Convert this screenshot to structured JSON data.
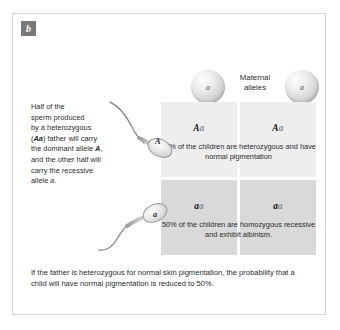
{
  "panel": {
    "badge_letter": "b"
  },
  "sperm_description": {
    "line1": "Half of the",
    "line2": "sperm produced",
    "line3": "by a heterozygous",
    "line4_pre": "(",
    "line4_allele": "Aa",
    "line4_post": ") father will carry",
    "line5_pre": "the dominant allele ",
    "line5_allele": "A",
    "line5_post": ",",
    "line6": "and the other half will",
    "line7": "carry the recessive",
    "line8_pre": "allele ",
    "line8_allele": "a",
    "line8_post": "."
  },
  "maternal": {
    "label_line1": "Maternal",
    "label_line2": "alleles",
    "ovum_left_allele": "a",
    "ovum_right_allele": "a"
  },
  "sperm_cells": [
    {
      "name": "sperm-dominant",
      "allele": "A"
    },
    {
      "name": "sperm-recessive",
      "allele": "a"
    }
  ],
  "punnett": {
    "cells": [
      {
        "dominant": "A",
        "recessive": "a"
      },
      {
        "dominant": "A",
        "recessive": "a"
      },
      {
        "dominant": "a",
        "recessive": "a"
      },
      {
        "dominant": "a",
        "recessive": "a"
      }
    ],
    "outcome_top": "50% of the children are heterozygous and have normal pigmentation",
    "outcome_bottom": "50% of the children are homozygous recessive and exhibit albinism."
  },
  "caption": {
    "text": "If the father is heterozygous for normal skin pigmentation, the probability that a child will have normal pigmentation is reduced to 50%."
  },
  "colors": {
    "cell_light": "#eeeeee",
    "cell_dark": "#d9d9d9",
    "badge": "#787878",
    "card_border": "#d8d8d8",
    "text": "#2b2b2b"
  }
}
